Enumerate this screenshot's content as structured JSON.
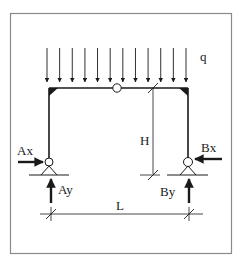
{
  "diagram": {
    "colors": {
      "stroke": "#1a1a1a",
      "border": "#8a8a8a",
      "background": "#ffffff"
    },
    "load": {
      "label": "q",
      "arrow_count": 12,
      "type": "uniformly-distributed"
    },
    "hinge": {
      "label": ""
    },
    "dimensions": {
      "height_label": "H",
      "span_label": "L"
    },
    "supports": {
      "left": {
        "horizontal_reaction": "Ax",
        "vertical_reaction": "Ay",
        "type": "pinned"
      },
      "right": {
        "horizontal_reaction": "Bx",
        "vertical_reaction": "By",
        "type": "pinned"
      }
    }
  }
}
